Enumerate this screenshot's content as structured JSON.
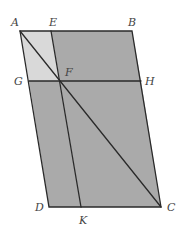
{
  "diagram": {
    "colors": {
      "background": "#ffffff",
      "light_fill": "#d9d9d9",
      "dark_fill": "#aaaaaa",
      "stroke": "#2a2a2a",
      "label": "#444444"
    },
    "points": {
      "A": {
        "label": "A",
        "x": 20,
        "y": 31
      },
      "E": {
        "label": "E",
        "x": 51,
        "y": 31
      },
      "B": {
        "label": "B",
        "x": 132,
        "y": 31
      },
      "G": {
        "label": "G",
        "x": 29,
        "y": 81
      },
      "F": {
        "label": "F",
        "x": 60,
        "y": 81
      },
      "H": {
        "label": "H",
        "x": 141,
        "y": 81
      },
      "D": {
        "label": "D",
        "x": 49,
        "y": 207
      },
      "K": {
        "label": "K",
        "x": 81,
        "y": 207
      },
      "C": {
        "label": "C",
        "x": 161,
        "y": 207
      }
    },
    "regions": [
      {
        "name": "AEFG",
        "shade": "light"
      },
      {
        "name": "EBHF",
        "shade": "dark"
      },
      {
        "name": "GFKD",
        "shade": "dark"
      },
      {
        "name": "FHCK",
        "shade": "dark"
      }
    ],
    "segments": [
      "AB",
      "BC",
      "CD",
      "DA",
      "AC",
      "EK",
      "GH"
    ]
  }
}
